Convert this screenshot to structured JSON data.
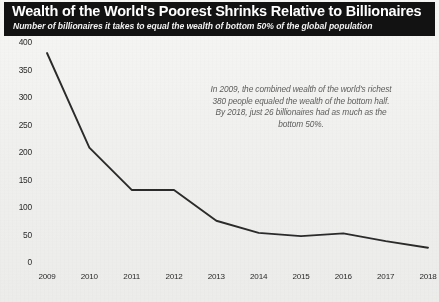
{
  "banner": {
    "title": "Wealth of the World's Poorest Shrinks Relative to Billionaires",
    "subtitle": "Number of billionaires it takes to equal the wealth of bottom 50% of the global population"
  },
  "annotation": {
    "text": "In 2009, the combined wealth of the world's richest 380 people equaled the wealth of the bottom half. By 2018, just 26 billionaires had as much as the bottom 50%."
  },
  "colors": {
    "banner_background": "#121212",
    "banner_text": "#ffffff",
    "line": "#2b2b2b",
    "page_background": "#f1f1ef",
    "annotation_text": "#5e5e5e"
  },
  "chart_data": {
    "type": "line",
    "title": "Wealth of the World's Poorest Shrinks Relative to Billionaires",
    "subtitle": "Number of billionaires it takes to equal the wealth of bottom 50% of the global population",
    "xlabel": "",
    "ylabel": "",
    "categories": [
      "2009",
      "2010",
      "2011",
      "2012",
      "2013",
      "2014",
      "2015",
      "2016",
      "2017",
      "2018"
    ],
    "values": [
      380,
      208,
      131,
      131,
      75,
      53,
      47,
      52,
      38,
      26
    ],
    "series": [
      {
        "name": "Number of billionaires equal to bottom 50% wealth",
        "values": [
          380,
          208,
          131,
          131,
          75,
          53,
          47,
          52,
          38,
          26
        ]
      }
    ],
    "ylim": [
      0,
      400
    ],
    "yticks": [
      0,
      50,
      100,
      150,
      200,
      250,
      300,
      350,
      400
    ],
    "xticks": [
      "2009",
      "2010",
      "2011",
      "2012",
      "2013",
      "2014",
      "2015",
      "2016",
      "2017",
      "2018"
    ],
    "grid": false,
    "legend": false,
    "markers": false
  }
}
